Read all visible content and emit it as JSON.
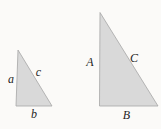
{
  "figure": {
    "colors": {
      "background": "#fbfaf8",
      "triangle_fill": "#d9d9d9",
      "triangle_stroke": "#a6a6a6",
      "label_color": "#1f1f1f"
    },
    "small_triangle": {
      "vertices": [
        [
          18,
          50
        ],
        [
          16,
          106
        ],
        [
          52,
          106
        ]
      ],
      "labels": {
        "side_a": {
          "text": "a",
          "x": 11,
          "y": 83
        },
        "side_c": {
          "text": "c",
          "x": 38.5,
          "y": 76
        },
        "side_b": {
          "text": "b",
          "x": 34,
          "y": 118
        }
      }
    },
    "large_triangle": {
      "vertices": [
        [
          100,
          12.5
        ],
        [
          99.5,
          106
        ],
        [
          158,
          106
        ]
      ],
      "labels": {
        "side_A": {
          "text": "A",
          "x": 90,
          "y": 66
        },
        "side_C": {
          "text": "C",
          "x": 134,
          "y": 61.5
        },
        "side_B": {
          "text": "B",
          "x": 126.5,
          "y": 119
        }
      }
    }
  }
}
